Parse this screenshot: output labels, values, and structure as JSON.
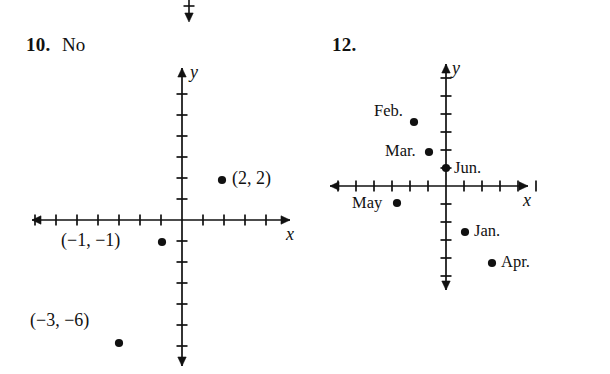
{
  "page": {
    "background": "#ffffff",
    "ink": "#111111",
    "width": 610,
    "height": 374
  },
  "top_fragment": {
    "name": "cropped-axis-arrow",
    "x": 189,
    "y": 0,
    "tick_y": 6,
    "arrow_end_y": 22
  },
  "exercises": [
    {
      "number": "10.",
      "number_x": 26,
      "number_y": 34,
      "answer": "No",
      "answer_x": 62,
      "answer_y": 34,
      "graph": {
        "origin": {
          "x": 182,
          "y": 220
        },
        "tick_spacing": 21,
        "x_axis": {
          "left": 32,
          "right": 290,
          "ticks_left": 7,
          "ticks_right": 4
        },
        "y_axis": {
          "top": 68,
          "bottom": 366,
          "ticks_up": 6,
          "ticks_down": 6
        },
        "x_axis_label": "x",
        "y_axis_label": "y",
        "points": [
          {
            "label": "(2, 2)",
            "px": 222,
            "py": 180,
            "label_side": "right",
            "label_x": 232,
            "label_y": 180
          },
          {
            "label": "(−1, −1)",
            "px": 162,
            "py": 242,
            "label_side": "left",
            "label_x": 61,
            "label_y": 242
          },
          {
            "label": "(−3, −6)",
            "px": 119,
            "py": 343,
            "label_side": "above-left",
            "label_x": 30,
            "label_y": 322
          }
        ]
      }
    },
    {
      "number": "12.",
      "number_x": 332,
      "number_y": 34,
      "answer": "",
      "graph": {
        "origin": {
          "x": 446,
          "y": 186
        },
        "tick_spacing": 18,
        "x_axis": {
          "left": 330,
          "right": 528,
          "ticks_left": 6,
          "ticks_right": 5
        },
        "y_axis": {
          "top": 64,
          "bottom": 290,
          "ticks_up": 6,
          "ticks_down": 5
        },
        "x_axis_label": "x",
        "y_axis_label": "y",
        "points": [
          {
            "label": "Feb.",
            "px": 414,
            "py": 122,
            "label_side": "left",
            "label_x": 374,
            "label_y": 113
          },
          {
            "label": "Mar.",
            "px": 429,
            "py": 152,
            "label_side": "left",
            "label_x": 385,
            "label_y": 152
          },
          {
            "label": "Jun.",
            "px": 446,
            "py": 168,
            "label_side": "right",
            "label_x": 454,
            "label_y": 170
          },
          {
            "label": "May",
            "px": 397,
            "py": 203,
            "label_side": "left",
            "label_x": 352,
            "label_y": 204
          },
          {
            "label": "Jan.",
            "px": 465,
            "py": 232,
            "label_side": "right",
            "label_x": 474,
            "label_y": 232
          },
          {
            "label": "Apr.",
            "px": 492,
            "py": 263,
            "label_side": "right",
            "label_x": 501,
            "label_y": 263
          }
        ]
      }
    }
  ]
}
